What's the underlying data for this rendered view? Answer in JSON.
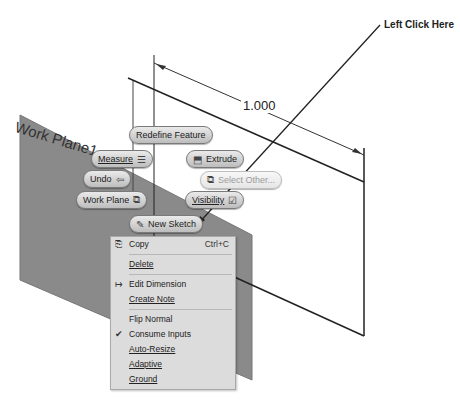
{
  "callout": {
    "text": "Left Click Here"
  },
  "dimension": {
    "value": "1.000"
  },
  "work_plane": {
    "label": "Work Plane1"
  },
  "mini_toolbar": {
    "redefine_feature": {
      "label": "Redefine Feature"
    },
    "measure": {
      "label": "Measure",
      "icon": "ruler-icon"
    },
    "extrude": {
      "label": "Extrude",
      "icon": "extrude-icon"
    },
    "undo": {
      "label": "Undo",
      "icon": "undo-arrow-icon"
    },
    "select_other": {
      "label": "Select Other...",
      "icon": "select-other-icon",
      "enabled": false
    },
    "work_plane": {
      "label": "Work Plane",
      "icon": "work-plane-icon"
    },
    "visibility": {
      "label": "Visibility",
      "icon": "checkbox-icon"
    },
    "new_sketch": {
      "label": "New Sketch",
      "icon": "sketch-icon"
    }
  },
  "context_menu": {
    "items": [
      {
        "label": "Copy",
        "shortcut": "Ctrl+C",
        "icon": "copy-icon"
      },
      {
        "label": "Delete"
      },
      {
        "label": "Edit Dimension",
        "icon": "edit-dimension-icon"
      },
      {
        "label": "Create Note"
      },
      {
        "label": "Flip Normal"
      },
      {
        "label": "Consume Inputs",
        "checked": true
      },
      {
        "label": "Auto-Resize"
      },
      {
        "label": "Adaptive"
      },
      {
        "label": "Ground"
      }
    ]
  },
  "colors": {
    "plane_fill": "#8a8a8a",
    "menu_bg": "#dcdcdc",
    "pill_bg": "#d4d4d4"
  }
}
